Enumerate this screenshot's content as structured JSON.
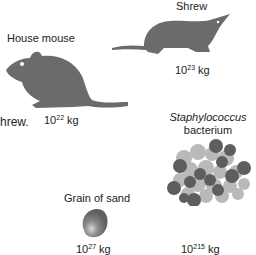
{
  "figure": {
    "items": [
      {
        "name": "House mouse",
        "mass_base": "10",
        "mass_exp": "22",
        "mass_unit": "kg"
      },
      {
        "name": "Shrew",
        "mass_base": "10",
        "mass_exp": "23",
        "mass_unit": "kg"
      },
      {
        "name_line1": "Staphylococcus",
        "name_line2": "bacterium",
        "mass_base": "10",
        "mass_exp": "215",
        "mass_unit": "kg"
      },
      {
        "name": "Grain of sand",
        "mass_base": "10",
        "mass_exp": "27",
        "mass_unit": "kg"
      }
    ],
    "fragment_text": "hrew.",
    "colors": {
      "silhouette": "#6b6b6b",
      "cell_dark": "#5e5e5e",
      "cell_light": "#b9b9b9",
      "sand": "#6f6f6f"
    }
  }
}
